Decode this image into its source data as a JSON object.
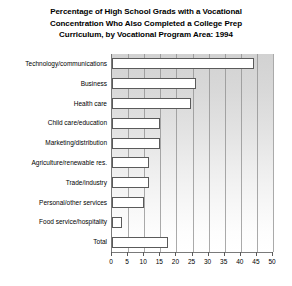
{
  "chart_data": {
    "type": "bar",
    "orientation": "horizontal",
    "title": "Percentage of High School Grads with a Vocational Concentration Who Also Completed a College Prep Curriculum, by Vocational Program Area: 1994",
    "title_lines": [
      "Percentage of High School Grads with a Vocational",
      "Concentration Who Also Completed a College Prep",
      "Curriculum, by Vocational Program Area: 1994"
    ],
    "categories": [
      "Technology/communications",
      "Business",
      "Health care",
      "Child care/education",
      "Marketing/distribution",
      "Agriculture/renewable res.",
      "Trade/industry",
      "Personal/other services",
      "Food service/hospitality",
      "Total"
    ],
    "values": [
      44,
      26,
      24.5,
      15,
      15,
      11.5,
      11.5,
      10,
      3,
      17.5
    ],
    "xlabel": "",
    "ylabel": "",
    "xlim": [
      0,
      50
    ],
    "xticks": [
      0,
      5,
      10,
      15,
      20,
      25,
      30,
      35,
      40,
      45,
      50
    ],
    "xtick_labels": [
      "0",
      "5",
      "10",
      "15",
      "20",
      "25",
      "30",
      "35",
      "40",
      "45",
      "50"
    ],
    "grid": true,
    "grid_axis": "x",
    "legend": false,
    "bar_fill_color": "#ffffff",
    "bar_edge_color": "#5a5a5a",
    "plot_background_color": "#dcdcdc",
    "gridline_color": "#8d8d8d",
    "axis_color": "#7a7a7a"
  }
}
